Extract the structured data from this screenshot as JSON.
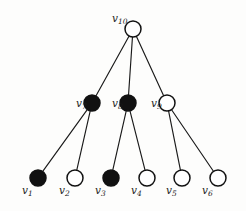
{
  "figure": {
    "background_color": "#fdfdfc",
    "stroke_color": "#111111",
    "filled_color": "#111111",
    "open_color": "#ffffff"
  },
  "chart_data": {
    "type": "diagram",
    "subtype": "graph-tree",
    "title": "",
    "node_radius": 8,
    "nodes": [
      {
        "id": "v1",
        "label": "v",
        "sub": "1",
        "x": 38,
        "y": 178,
        "fill": "filled",
        "label_x": 22,
        "label_y": 191,
        "level": 0
      },
      {
        "id": "v2",
        "label": "v",
        "sub": "2",
        "x": 75,
        "y": 178,
        "fill": "open",
        "label_x": 59,
        "label_y": 191,
        "level": 0
      },
      {
        "id": "v3",
        "label": "v",
        "sub": "3",
        "x": 111,
        "y": 178,
        "fill": "filled",
        "label_x": 95,
        "label_y": 191,
        "level": 0
      },
      {
        "id": "v4",
        "label": "v",
        "sub": "4",
        "x": 147,
        "y": 178,
        "fill": "open",
        "label_x": 131,
        "label_y": 191,
        "level": 0
      },
      {
        "id": "v5",
        "label": "v",
        "sub": "5",
        "x": 182,
        "y": 178,
        "fill": "open",
        "label_x": 166,
        "label_y": 191,
        "level": 0
      },
      {
        "id": "v6",
        "label": "v",
        "sub": "6",
        "x": 218,
        "y": 178,
        "fill": "open",
        "label_x": 202,
        "label_y": 191,
        "level": 0
      },
      {
        "id": "v7",
        "label": "v",
        "sub": "7",
        "x": 92,
        "y": 103,
        "fill": "filled",
        "label_x": 76,
        "label_y": 104,
        "level": 1
      },
      {
        "id": "v8",
        "label": "v",
        "sub": "8",
        "x": 128,
        "y": 103,
        "fill": "filled",
        "label_x": 112,
        "label_y": 104,
        "level": 1
      },
      {
        "id": "v9",
        "label": "v",
        "sub": "9",
        "x": 167,
        "y": 103,
        "fill": "open",
        "label_x": 151,
        "label_y": 104,
        "level": 1
      },
      {
        "id": "v10",
        "label": "v",
        "sub": "10",
        "x": 133,
        "y": 29,
        "fill": "open",
        "label_x": 112,
        "label_y": 19,
        "level": 2
      }
    ],
    "edges": [
      {
        "from": "v10",
        "to": "v7"
      },
      {
        "from": "v10",
        "to": "v8"
      },
      {
        "from": "v10",
        "to": "v9"
      },
      {
        "from": "v7",
        "to": "v1"
      },
      {
        "from": "v7",
        "to": "v2"
      },
      {
        "from": "v8",
        "to": "v3"
      },
      {
        "from": "v8",
        "to": "v4"
      },
      {
        "from": "v9",
        "to": "v5"
      },
      {
        "from": "v9",
        "to": "v6"
      }
    ],
    "legend": []
  }
}
